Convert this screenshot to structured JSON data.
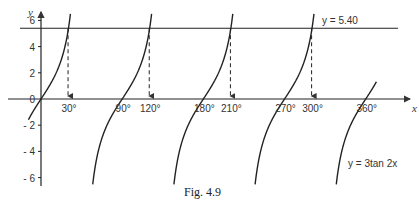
{
  "chart_data": {
    "type": "line",
    "title": "",
    "caption": "Fig. 4.9",
    "xlabel": "x",
    "ylabel": "y",
    "xlim": [
      0,
      375
    ],
    "ylim": [
      -6.5,
      6.5
    ],
    "x_ticks": [
      30,
      90,
      120,
      180,
      210,
      270,
      300,
      360
    ],
    "x_tick_labels": [
      "30°",
      "90°",
      "120°",
      "180°",
      "210°",
      "270°",
      "300°",
      "360°"
    ],
    "y_ticks": [
      -6,
      -4,
      -2,
      0,
      2,
      4,
      6
    ],
    "y_tick_labels": [
      "- 6",
      "- 4",
      "- 2",
      "0",
      "2",
      "4",
      "6"
    ],
    "grid": false,
    "series": [
      {
        "name": "y = 3tan 2x",
        "function": "3*tan(2x)",
        "label": "y = 3tan 2x"
      },
      {
        "name": "y = 5.40",
        "function": "5.40",
        "label": "y = 5.40"
      }
    ],
    "intersections_x": [
      30,
      120,
      210,
      300
    ],
    "annotations": [
      {
        "text": "y = 5.40",
        "x": 310,
        "y": 5.9
      },
      {
        "text": "y = 3tan 2x",
        "x": 355,
        "y": -4.8
      }
    ]
  }
}
